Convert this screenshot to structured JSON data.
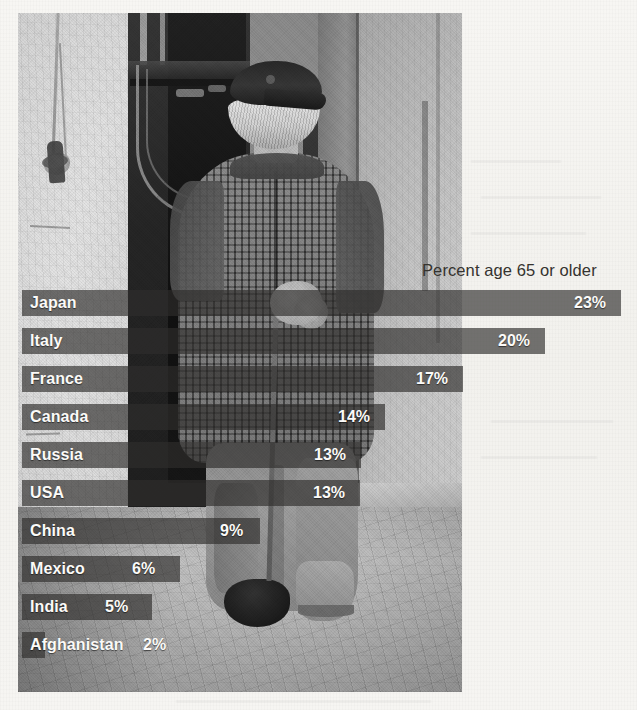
{
  "figure": {
    "header_label": "Percent age 65 or older",
    "background_color": "#f5f4f1",
    "bar_color": "#4a4845",
    "label_color": "#fbfaf8",
    "header_color": "#35332f",
    "photo": {
      "description": "Black-and-white photograph of an elderly man in a checked tweed coat and flat cap, walking away down a narrow cobblestone alley with a cane",
      "name": "elderly-man-walking-photo"
    }
  },
  "chart_data": {
    "type": "bar",
    "orientation": "horizontal",
    "title": "",
    "subtitle": "",
    "xlabel": "Percent age 65 or older",
    "ylabel": "",
    "grid": false,
    "legend": null,
    "xlim": [
      0,
      23
    ],
    "unit": "%",
    "value_suffix": "%",
    "categories": [
      "Japan",
      "Italy",
      "France",
      "Canada",
      "Russia",
      "USA",
      "China",
      "Mexico",
      "India",
      "Afghanistan"
    ],
    "values": [
      23,
      20,
      17,
      14,
      13,
      13,
      9,
      6,
      5,
      2
    ],
    "labels": [
      "23%",
      "20%",
      "17%",
      "14%",
      "13%",
      "13%",
      "9%",
      "6%",
      "5%",
      "2%"
    ],
    "bars": [
      {
        "category": "Japan",
        "value": 23,
        "label": "23%",
        "bar_width_px": 599,
        "value_x_px": 552,
        "row_top_px": 290
      },
      {
        "category": "Italy",
        "value": 20,
        "label": "20%",
        "bar_width_px": 523,
        "value_x_px": 476,
        "row_top_px": 328
      },
      {
        "category": "France",
        "value": 17,
        "label": "17%",
        "bar_width_px": 441,
        "value_x_px": 394,
        "row_top_px": 366
      },
      {
        "category": "Canada",
        "value": 14,
        "label": "14%",
        "bar_width_px": 363,
        "value_x_px": 316,
        "row_top_px": 404
      },
      {
        "category": "Russia",
        "value": 13,
        "label": "13%",
        "bar_width_px": 339,
        "value_x_px": 292,
        "row_top_px": 442
      },
      {
        "category": "USA",
        "value": 13,
        "label": "13%",
        "bar_width_px": 338,
        "value_x_px": 291,
        "row_top_px": 480
      },
      {
        "category": "China",
        "value": 9,
        "label": "9%",
        "bar_width_px": 238,
        "value_x_px": 198,
        "row_top_px": 518
      },
      {
        "category": "Mexico",
        "value": 6,
        "label": "6%",
        "bar_width_px": 158,
        "value_x_px": 110,
        "row_top_px": 556
      },
      {
        "category": "India",
        "value": 5,
        "label": "5%",
        "bar_width_px": 130,
        "value_x_px": 83,
        "row_top_px": 594
      },
      {
        "category": "Afghanistan",
        "value": 2,
        "label": "2%",
        "bar_width_px": 23,
        "value_x_px": 121,
        "row_top_px": 632
      }
    ]
  }
}
